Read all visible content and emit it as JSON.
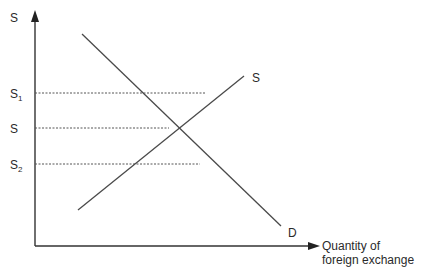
{
  "diagram": {
    "type": "supply-demand",
    "y_axis": {
      "label": "S"
    },
    "x_axis": {
      "label_line1": "Quantity of",
      "label_line2": "foreign exchange"
    },
    "price_levels": [
      {
        "label": "S",
        "subscript": "1",
        "y": 93,
        "x_end": 206
      },
      {
        "label": "S",
        "subscript": "",
        "y": 128,
        "x_end": 169
      },
      {
        "label": "S",
        "subscript": "2",
        "y": 164,
        "x_end": 200
      }
    ],
    "curves": [
      {
        "name": "supply",
        "label": "S",
        "x1": 78,
        "y1": 210,
        "x2": 244,
        "y2": 76
      },
      {
        "name": "demand",
        "label": "D",
        "x1": 82,
        "y1": 34,
        "x2": 281,
        "y2": 226
      }
    ],
    "equilibrium": {
      "x": 169,
      "y": 128
    },
    "colors": {
      "line": "#4a4a4a",
      "axis": "#333333",
      "text": "#2a2a2a"
    }
  }
}
